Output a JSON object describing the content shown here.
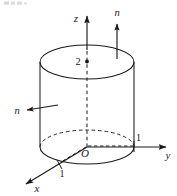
{
  "figure": {
    "background_color": "#ffffff",
    "stroke_color": "#1b1b1b",
    "labels": {
      "z_axis": "z",
      "y_axis": "y",
      "x_axis": "x",
      "origin": "O",
      "normal_top": "n",
      "normal_side": "n",
      "height_mark": "2",
      "tick_y": "1",
      "tick_x": "1"
    },
    "artifact_top_left": "",
    "geometry": {
      "axis_center_x": 87,
      "top_ellipse_center_y": 62,
      "bottom_ellipse_center_y": 147,
      "ellipse_rx": 47,
      "ellipse_ry": 17,
      "cylinder_height_px": 85,
      "radius_value": 1,
      "height_value": 2
    }
  }
}
